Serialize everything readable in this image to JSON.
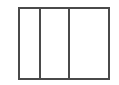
{
  "figure": {
    "name": "three-panel-rectangle",
    "background_color": "#ffffff",
    "stroke_color": "#4a4a4a",
    "stroke_width": 2,
    "labels": [],
    "canvas": {
      "width": 119,
      "height": 85
    },
    "outline": {
      "name": "outer-rectangle",
      "x": 19,
      "y": 8,
      "width": 90,
      "height": 71
    },
    "dividers": [
      {
        "name": "divider-left",
        "x": 40,
        "y_top": 8,
        "y_bottom": 79
      },
      {
        "name": "divider-right",
        "x": 69,
        "y_top": 8,
        "y_bottom": 79
      }
    ],
    "panels": [
      {
        "name": "panel-left",
        "x": 19,
        "width": 21,
        "fill": "#ffffff"
      },
      {
        "name": "panel-middle",
        "x": 40,
        "width": 29,
        "fill": "#ffffff"
      },
      {
        "name": "panel-right",
        "x": 69,
        "width": 40,
        "fill": "#ffffff"
      }
    ]
  }
}
